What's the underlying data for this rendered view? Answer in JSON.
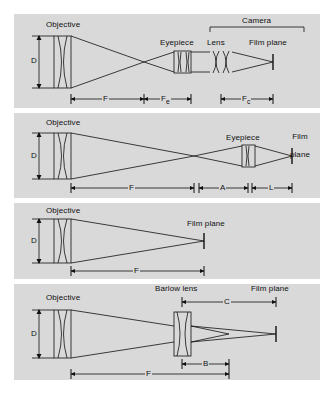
{
  "figure": {
    "background_color": "#ffffff",
    "panel_color": "#d9d9d9",
    "line_color": "#101010"
  },
  "panels": [
    {
      "id": "afocal-eyepiece-projection",
      "name": "Afocal / eyepiece with camera lens",
      "labels": {
        "objective": "Objective",
        "aperture": "D",
        "eyepiece": "Eyepiece",
        "camera_lens": "Lens",
        "film_plane": "Film plane",
        "camera_bracket": "Camera"
      },
      "dimensions": [
        {
          "symbol": "F",
          "sub": "",
          "name": "objective-focal-length"
        },
        {
          "symbol": "F",
          "sub": "e",
          "name": "eyepiece-focal-length"
        },
        {
          "symbol": "F",
          "sub": "c",
          "name": "camera-lens-focal-length"
        }
      ]
    },
    {
      "id": "eyepiece-projection",
      "name": "Eyepiece projection",
      "labels": {
        "objective": "Objective",
        "aperture": "D",
        "eyepiece": "Eyepiece",
        "film_plane_line1": "Film",
        "film_plane_line2": "plane"
      },
      "dimensions": [
        {
          "symbol": "F",
          "sub": "",
          "name": "objective-focal-length"
        },
        {
          "symbol": "A",
          "sub": "",
          "name": "eyepiece-to-focus-distance"
        },
        {
          "symbol": "L",
          "sub": "",
          "name": "eyepiece-to-film-distance"
        }
      ]
    },
    {
      "id": "prime-focus",
      "name": "Prime focus",
      "labels": {
        "objective": "Objective",
        "aperture": "D",
        "film_plane": "Film plane"
      },
      "dimensions": [
        {
          "symbol": "F",
          "sub": "",
          "name": "objective-focal-length"
        }
      ]
    },
    {
      "id": "barlow-lens",
      "name": "Barlow lens amplification",
      "labels": {
        "objective": "Objective",
        "aperture": "D",
        "barlow": "Barlow lens",
        "film_plane": "Film plane"
      },
      "dimensions": [
        {
          "symbol": "C",
          "sub": "",
          "name": "barlow-to-film-distance"
        },
        {
          "symbol": "B",
          "sub": "",
          "name": "barlow-to-prime-focus-distance"
        },
        {
          "symbol": "F",
          "sub": "",
          "name": "objective-focal-length"
        }
      ]
    }
  ]
}
